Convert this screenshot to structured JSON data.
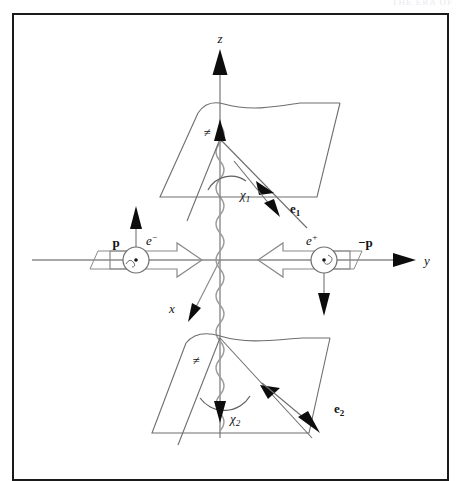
{
  "page": {
    "running_head": "THE ERA OF",
    "frame": {
      "border_color": "#1a1a1a",
      "background": "#ffffff"
    }
  },
  "figure": {
    "title": "",
    "axes": [
      {
        "name": "z-axis",
        "label": "z",
        "direction": "up",
        "label_italic": true
      },
      {
        "name": "y-axis",
        "label": "y",
        "direction": "right",
        "label_italic": true
      },
      {
        "name": "x-axis",
        "label": "x",
        "direction": "down-left",
        "label_italic": true
      }
    ],
    "particles": [
      {
        "name": "electron",
        "label": "e",
        "charge": "−",
        "momentum_label": "p",
        "momentum_sign": "",
        "spin": "up",
        "side": "left"
      },
      {
        "name": "positron",
        "label": "e",
        "charge": "+",
        "momentum_label": "p",
        "momentum_sign": "−",
        "spin": "down",
        "side": "right"
      }
    ],
    "angles": [
      {
        "name": "chi-1",
        "symbol": "χ",
        "subscript": "1",
        "plane": "upper"
      },
      {
        "name": "chi-2",
        "symbol": "χ",
        "subscript": "2",
        "plane": "lower"
      }
    ],
    "decay_vectors": [
      {
        "name": "e1",
        "symbol": "e",
        "subscript": "1",
        "plane": "upper"
      },
      {
        "name": "e2",
        "symbol": "e",
        "subscript": "2",
        "plane": "lower"
      }
    ],
    "plane_marks": [
      {
        "name": "upper-plane-hatch",
        "symbol": "≠"
      },
      {
        "name": "lower-plane-hatch",
        "symbol": "≠"
      }
    ],
    "propagator": {
      "name": "boson-propagator",
      "style": "wavy",
      "orientation": "vertical"
    },
    "colors": {
      "ink": "#141414",
      "thin_line": "#8a8a8a",
      "plane_line": "#6e6e6e",
      "arrow_fill": "#0d0d0d",
      "hollow_arrow_stroke": "#7d7d7d"
    }
  }
}
